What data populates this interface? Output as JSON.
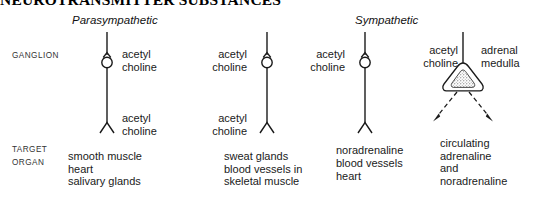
{
  "figure": {
    "title": "NEUROTRANSMITTER SUBSTANCES",
    "background_color": "#ffffff",
    "ink_color": "#1a1a1a"
  },
  "headings": {
    "parasympathetic": "Parasympathetic",
    "sympathetic": "Sympathetic"
  },
  "row_labels": {
    "ganglion": "GANGLION",
    "target": "TARGET",
    "organ": "ORGAN"
  },
  "pathways": [
    {
      "id": "parasympathetic-main",
      "division": "Parasympathetic",
      "preganglionic_transmitter": "acetyl\ncholine",
      "postganglionic_transmitter": "acetyl\ncholine",
      "label_side": "right",
      "target_organ": "smooth muscle\nheart\nsalivary glands"
    },
    {
      "id": "sympathetic-cholinergic",
      "division": "Sympathetic",
      "preganglionic_transmitter": "acetyl\ncholine",
      "postganglionic_transmitter": "acetyl\ncholine",
      "label_side": "left",
      "target_organ": "sweat glands\nblood vessels in\nskeletal muscle"
    },
    {
      "id": "sympathetic-adrenergic",
      "division": "Sympathetic",
      "preganglionic_transmitter": "acetyl\ncholine",
      "postganglionic_transmitter": "noradrenaline",
      "label_side": "left",
      "target_organ": "blood vessels\nheart"
    },
    {
      "id": "sympathetic-adrenal",
      "division": "Sympathetic",
      "preganglionic_transmitter": "acetyl\ncholine",
      "organ_name": "adrenal\nmedulla",
      "label_side": "left",
      "output": "circulating\nadrenaline\nand\nnoradrenaline"
    }
  ]
}
